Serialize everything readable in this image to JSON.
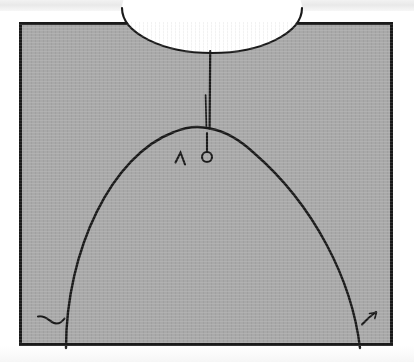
{
  "figure": {
    "caption": "",
    "media": "scanned line drawing",
    "canvas": {
      "width": 414,
      "height": 362
    },
    "colors": {
      "page_background": "#ffffff",
      "panel_fill": "#a9a9a9",
      "ink": "#1a1a1a",
      "opening_fill": "#ffffff",
      "scan_band": "#eeeeee"
    },
    "frame": {
      "name": "panel-border",
      "x": 19,
      "y": 22,
      "width": 374,
      "height": 324,
      "stroke_width": 3
    },
    "shapes": [
      {
        "id": "neckline-opening",
        "label": "neckline opening",
        "kind": "ellipse-cut",
        "center_x": 212,
        "center_y": 8,
        "radius_x": 90,
        "radius_y": 45,
        "fill": "#ffffff"
      },
      {
        "id": "center-seam",
        "label": "center front seam",
        "kind": "line",
        "x1": 210,
        "y1": 52,
        "x2": 210,
        "y2": 129
      },
      {
        "id": "seam-guide",
        "label": "seam guide line",
        "kind": "line",
        "x1": 206,
        "y1": 95,
        "x2": 207,
        "y2": 128
      },
      {
        "id": "dome-arc",
        "label": "dome dart curve",
        "kind": "arc",
        "apex_x": 210,
        "apex_y": 128,
        "left_foot_x": 66,
        "left_foot_y": 347,
        "right_foot_x": 360,
        "right_foot_y": 347
      },
      {
        "id": "pin-marker",
        "label": "pin marker",
        "kind": "stem-and-ring",
        "stem_x": 207,
        "stem_top_y": 133,
        "stem_bottom_y": 152,
        "ring_cx": 207,
        "ring_cy": 157,
        "ring_r": 5
      },
      {
        "id": "notch-mark",
        "label": "notch mark",
        "kind": "caret",
        "x": 180,
        "y": 160
      },
      {
        "id": "hem-tick-left",
        "label": "left hem tick",
        "kind": "hook",
        "x": 40,
        "y": 318
      },
      {
        "id": "hem-tick-right",
        "label": "right hem tick",
        "kind": "hook",
        "x": 372,
        "y": 318
      }
    ]
  }
}
